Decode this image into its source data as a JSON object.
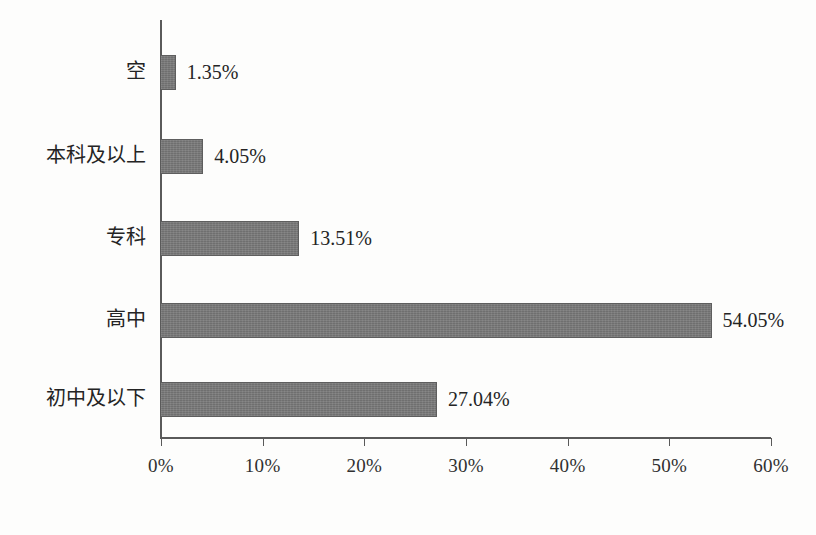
{
  "chart_data": {
    "type": "bar",
    "orientation": "horizontal",
    "title": "",
    "subtitle": "",
    "xlabel": "",
    "ylabel": "",
    "categories": [
      "空",
      "本科及以上",
      "专科",
      "高中",
      "初中及以下"
    ],
    "values": [
      1.35,
      4.05,
      13.51,
      54.05,
      27.04
    ],
    "value_labels": [
      "1.35%",
      "4.05%",
      "13.51%",
      "54.05%",
      "27.04%"
    ],
    "xlim": [
      0,
      60
    ],
    "xtick_values": [
      0,
      10,
      20,
      30,
      40,
      50,
      60
    ],
    "xtick_labels": [
      "0%",
      "10%",
      "20%",
      "30%",
      "40%",
      "50%",
      "60%"
    ],
    "grid": false,
    "legend": null,
    "bar_color": "#6f6f6f",
    "axis_color": "#5a5a5a",
    "background_color": "#fdfdfc"
  }
}
